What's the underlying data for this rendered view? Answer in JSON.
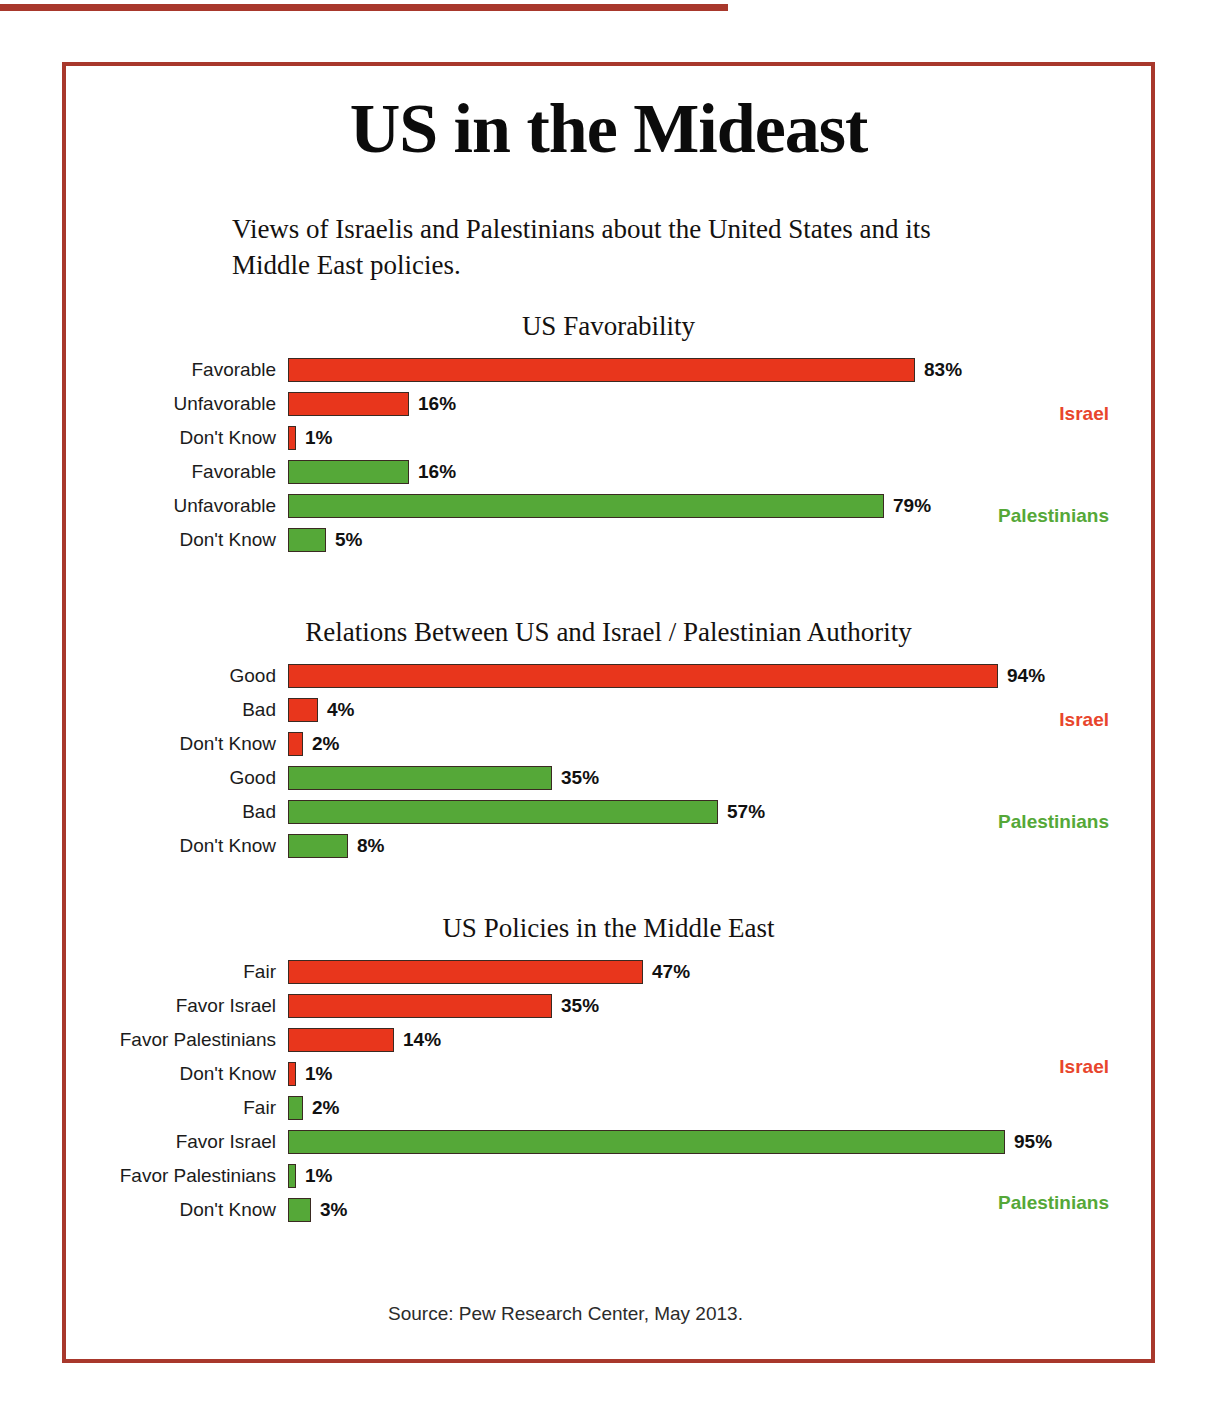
{
  "title": "US in the Mideast",
  "subtitle": "Views of Israelis and Palestinians about the United States and its Middle East policies.",
  "source": "Source: Pew Research Center, May 2013.",
  "legend": {
    "israel": "Israel",
    "palestinians": "Palestinians"
  },
  "colors": {
    "israel_bar": "#e8361c",
    "palestinian_bar": "#55a838",
    "israel_label": "#e8452c",
    "palestinian_label": "#55a838",
    "frame": "#a8382c",
    "bar_outline": "#3a2a22"
  },
  "chart_data": [
    {
      "type": "bar",
      "title": "US Favorability",
      "orientation": "horizontal",
      "xlabel": "",
      "ylabel": "",
      "xlim": [
        0,
        100
      ],
      "unit": "%",
      "grid": false,
      "legend_position": "right",
      "categories": [
        "Favorable",
        "Unfavorable",
        "Don't Know"
      ],
      "series": [
        {
          "name": "Israel",
          "color": "#e8361c",
          "values": [
            83,
            16,
            1
          ],
          "labels": [
            "83%",
            "16%",
            "1%"
          ]
        },
        {
          "name": "Palestinians",
          "color": "#55a838",
          "values": [
            16,
            79,
            5
          ],
          "labels": [
            "16%",
            "79%",
            "5%"
          ]
        }
      ],
      "rows": [
        {
          "label": "Favorable",
          "value": 83,
          "value_label": "83%",
          "group": "Israel",
          "color": "red"
        },
        {
          "label": "Unfavorable",
          "value": 16,
          "value_label": "16%",
          "group": "Israel",
          "color": "red"
        },
        {
          "label": "Don't Know",
          "value": 1,
          "value_label": "1%",
          "group": "Israel",
          "color": "red"
        },
        {
          "label": "Favorable",
          "value": 16,
          "value_label": "16%",
          "group": "Palestinians",
          "color": "green"
        },
        {
          "label": "Unfavorable",
          "value": 79,
          "value_label": "79%",
          "group": "Palestinians",
          "color": "green"
        },
        {
          "label": "Don't Know",
          "value": 5,
          "value_label": "5%",
          "group": "Palestinians",
          "color": "green"
        }
      ]
    },
    {
      "type": "bar",
      "title": "Relations Between US and Israel / Palestinian Authority",
      "orientation": "horizontal",
      "xlabel": "",
      "ylabel": "",
      "xlim": [
        0,
        100
      ],
      "unit": "%",
      "grid": false,
      "legend_position": "right",
      "categories": [
        "Good",
        "Bad",
        "Don't Know"
      ],
      "series": [
        {
          "name": "Israel",
          "color": "#e8361c",
          "values": [
            94,
            4,
            2
          ],
          "labels": [
            "94%",
            "4%",
            "2%"
          ]
        },
        {
          "name": "Palestinians",
          "color": "#55a838",
          "values": [
            35,
            57,
            8
          ],
          "labels": [
            "35%",
            "57%",
            "8%"
          ]
        }
      ],
      "rows": [
        {
          "label": "Good",
          "value": 94,
          "value_label": "94%",
          "group": "Israel",
          "color": "red"
        },
        {
          "label": "Bad",
          "value": 4,
          "value_label": "4%",
          "group": "Israel",
          "color": "red"
        },
        {
          "label": "Don't Know",
          "value": 2,
          "value_label": "2%",
          "group": "Israel",
          "color": "red"
        },
        {
          "label": "Good",
          "value": 35,
          "value_label": "35%",
          "group": "Palestinians",
          "color": "green"
        },
        {
          "label": "Bad",
          "value": 57,
          "value_label": "57%",
          "group": "Palestinians",
          "color": "green"
        },
        {
          "label": "Don't Know",
          "value": 8,
          "value_label": "8%",
          "group": "Palestinians",
          "color": "green"
        }
      ]
    },
    {
      "type": "bar",
      "title": "US Policies in the Middle East",
      "orientation": "horizontal",
      "xlabel": "",
      "ylabel": "",
      "xlim": [
        0,
        100
      ],
      "unit": "%",
      "grid": false,
      "legend_position": "right",
      "categories": [
        "Fair",
        "Favor Israel",
        "Favor Palestinians",
        "Don't Know"
      ],
      "series": [
        {
          "name": "Israel",
          "color": "#e8361c",
          "values": [
            47,
            35,
            14,
            1
          ],
          "labels": [
            "47%",
            "35%",
            "14%",
            "1%"
          ]
        },
        {
          "name": "Palestinians",
          "color": "#55a838",
          "values": [
            2,
            95,
            1,
            3
          ],
          "labels": [
            "2%",
            "95%",
            "1%",
            "3%"
          ]
        }
      ],
      "rows": [
        {
          "label": "Fair",
          "value": 47,
          "value_label": "47%",
          "group": "Israel",
          "color": "red"
        },
        {
          "label": "Favor Israel",
          "value": 35,
          "value_label": "35%",
          "group": "Israel",
          "color": "red"
        },
        {
          "label": "Favor Palestinians",
          "value": 14,
          "value_label": "14%",
          "group": "Israel",
          "color": "red"
        },
        {
          "label": "Don't Know",
          "value": 1,
          "value_label": "1%",
          "group": "Israel",
          "color": "red"
        },
        {
          "label": "Fair",
          "value": 2,
          "value_label": "2%",
          "group": "Palestinians",
          "color": "green"
        },
        {
          "label": "Favor Israel",
          "value": 95,
          "value_label": "95%",
          "group": "Palestinians",
          "color": "green"
        },
        {
          "label": "Favor Palestinians",
          "value": 1,
          "value_label": "1%",
          "group": "Palestinians",
          "color": "green"
        },
        {
          "label": "Don't Know",
          "value": 3,
          "value_label": "3%",
          "group": "Palestinians",
          "color": "green"
        }
      ]
    }
  ]
}
